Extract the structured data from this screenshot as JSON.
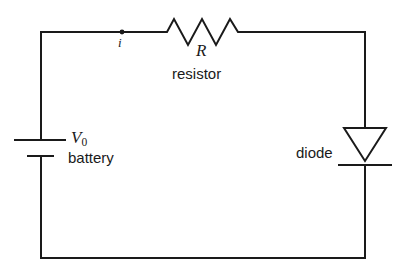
{
  "figure": {
    "kind": "circuit-diagram",
    "width": 404,
    "height": 274,
    "background_color": "#ffffff",
    "line_color": "#1a1a1a"
  },
  "labels": {
    "current": "i",
    "resistance_symbol": "R",
    "resistor_name": "resistor",
    "battery_voltage_symbol": "V",
    "battery_voltage_subscript": "0",
    "battery_name": "battery",
    "diode_name": "diode"
  },
  "components": [
    {
      "id": "battery",
      "icon_name": "battery-symbol",
      "symbol_label": "V0",
      "caption": "battery",
      "position": "left-branch",
      "long_plate_y": 140,
      "short_plate_y": 156
    },
    {
      "id": "resistor",
      "icon_name": "resistor-zigzag-symbol",
      "symbol_label": "R",
      "caption": "resistor",
      "position": "top-branch",
      "zigzag_peaks": 3,
      "start_x": 160,
      "end_x": 245
    },
    {
      "id": "diode",
      "icon_name": "diode-triangle-symbol",
      "symbol_label": "",
      "caption": "diode",
      "position": "right-branch",
      "orientation": "pointing-down",
      "apex_y": 160,
      "cathode_bar_y": 165
    }
  ],
  "wires": {
    "loop_left_x": 41,
    "loop_right_x": 365,
    "loop_top_y": 32,
    "loop_bottom_y": 258,
    "current_node": {
      "x": 122,
      "y": 32,
      "label": "i"
    }
  }
}
